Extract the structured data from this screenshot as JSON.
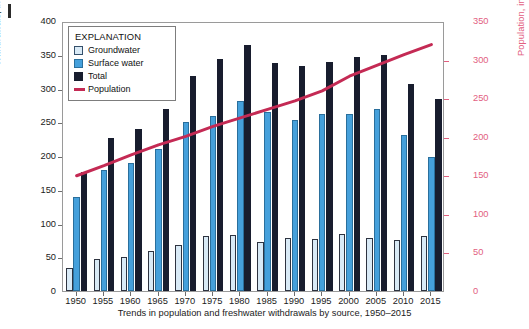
{
  "figure": {
    "caption": "Trends in population and freshwater withdrawals by source, 1950–2015",
    "left_axis_label": "Withdrawals, in billion gallons per day",
    "right_axis_label": "Population, in millions"
  },
  "legend": {
    "title": "EXPLANATION",
    "items": [
      {
        "label": "Groundwater",
        "marker": "square-swatch-lightblue",
        "color": "#d9eaf6"
      },
      {
        "label": "Surface water",
        "marker": "square-swatch-blue",
        "color": "#45a0db"
      },
      {
        "label": "Total",
        "marker": "square-swatch-black",
        "color": "#181d2e"
      },
      {
        "label": "Population",
        "marker": "line-swatch-red",
        "color": "#c42a54"
      }
    ]
  },
  "colors": {
    "groundwater": "#d9eaf6",
    "surface_water": "#45a0db",
    "total": "#181d2e",
    "population_line": "#c42a54",
    "right_axis_text": "#e2607f",
    "frame": "#9a9a9a"
  },
  "chart_data": {
    "type": "bar",
    "title": "Trends in population and freshwater withdrawals by source, 1950–2015",
    "xlabel": "",
    "ylabel": "Withdrawals, in billion gallons per day",
    "y2label": "Population, in millions",
    "ylim": [
      0,
      400
    ],
    "y2lim": [
      0,
      350
    ],
    "yticks": [
      0,
      50,
      100,
      150,
      200,
      250,
      300,
      350,
      400
    ],
    "y2ticks": [
      0,
      50,
      100,
      150,
      200,
      250,
      300,
      350
    ],
    "grid": false,
    "legend_position": "top-left inside",
    "categories": [
      "1950",
      "1955",
      "1960",
      "1965",
      "1970",
      "1975",
      "1980",
      "1985",
      "1990",
      "1995",
      "2000",
      "2005",
      "2010",
      "2015"
    ],
    "series": [
      {
        "name": "Groundwater",
        "axis": "left",
        "type": "bar",
        "values": [
          34,
          47,
          50,
          60,
          68,
          82,
          83,
          73,
          79,
          77,
          84,
          79,
          76,
          82
        ]
      },
      {
        "name": "Surface water",
        "axis": "left",
        "type": "bar",
        "values": [
          140,
          180,
          190,
          210,
          250,
          260,
          281,
          265,
          254,
          262,
          262,
          270,
          231,
          199
        ]
      },
      {
        "name": "Total",
        "axis": "left",
        "type": "bar",
        "values": [
          176,
          226,
          240,
          270,
          318,
          343,
          365,
          338,
          334,
          339,
          346,
          349,
          307,
          284
        ]
      },
      {
        "name": "Population",
        "axis": "right",
        "type": "line",
        "values": [
          152,
          165,
          179,
          192,
          203,
          216,
          227,
          238,
          249,
          262,
          281,
          295,
          309,
          322
        ]
      }
    ]
  }
}
